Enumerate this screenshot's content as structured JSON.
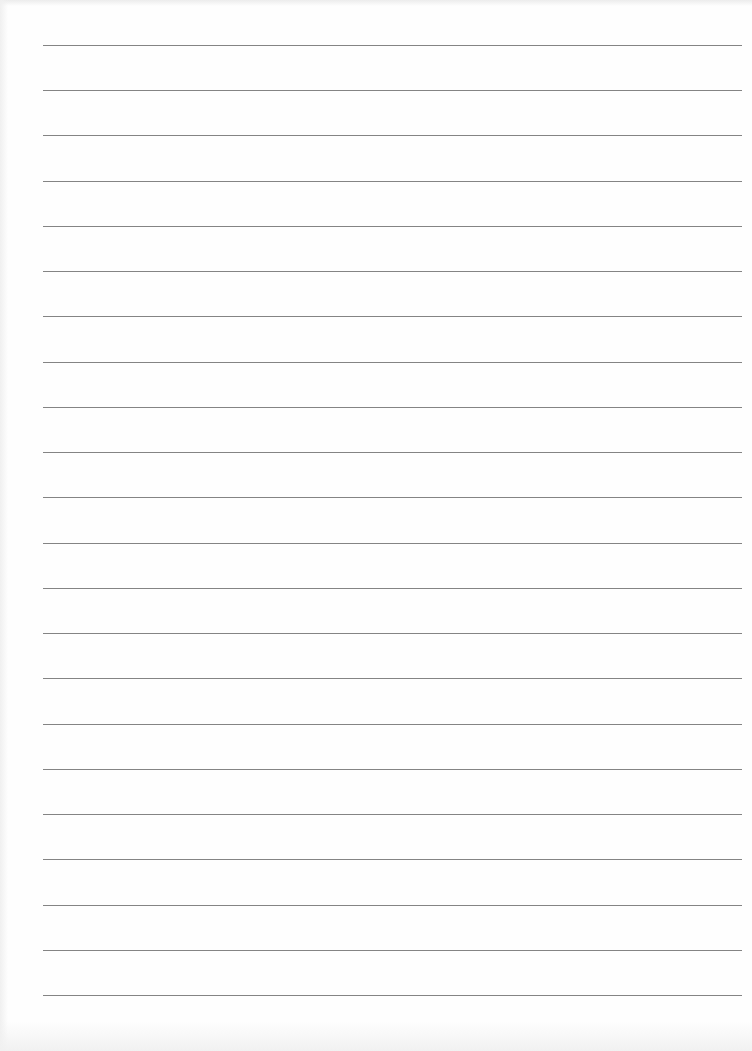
{
  "page": {
    "type": "lined-paper",
    "background_color": "#fefefe",
    "line_color": "#6e6e6e",
    "line_count": 22,
    "first_line_y": 45,
    "line_spacing": 45.24,
    "line_left": 43,
    "line_right": 742
  }
}
